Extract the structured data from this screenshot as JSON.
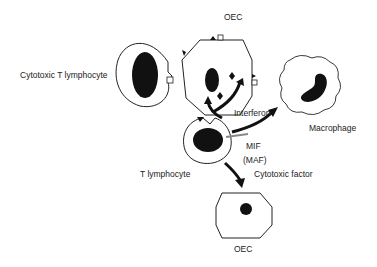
{
  "labels": {
    "oec_top": "OEC",
    "cytotoxic_t_lymphocyte": "Cytotoxic T lymphocyte",
    "interferon": "Interferon",
    "macrophage": "Macrophage",
    "t_lymphocyte": "T lymphocyte",
    "mif": "MIF",
    "maf": "(MAF)",
    "cytotoxic_factor": "Cytotoxic factor",
    "oec_bottom": "OEC"
  },
  "colors": {
    "stroke": "#222222",
    "fill": "#111111",
    "background": "#ffffff"
  }
}
